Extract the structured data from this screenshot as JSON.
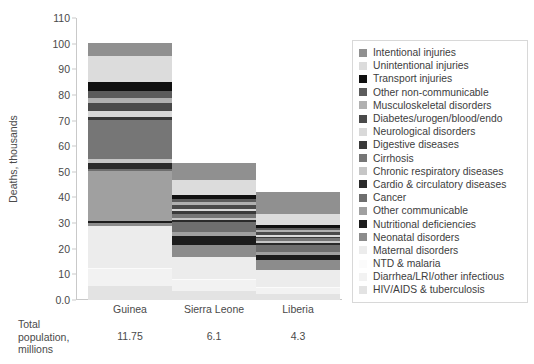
{
  "chart_data": {
    "type": "bar",
    "title": "",
    "subtitle": "",
    "xlabel": "",
    "ylabel": "Deaths, thousands",
    "ylim": [
      0,
      110
    ],
    "yticks": [
      "0.0",
      "10",
      "20",
      "30",
      "40",
      "50",
      "60",
      "70",
      "80",
      "90",
      "100",
      "110"
    ],
    "grid": false,
    "stacked": true,
    "legend_position": "right",
    "categories": [
      "Guinea",
      "Sierra Leone",
      "Liberia"
    ],
    "totals": [
      100.2,
      53.5,
      42.0
    ],
    "series": [
      {
        "name": "HIV/AIDS & tuberculosis",
        "color": "#e3e3e3",
        "values": [
          5.6,
          3.6,
          2.2
        ]
      },
      {
        "name": "Diarrhea/LRI/other infectious",
        "color": "#f2f2f2",
        "values": [
          6.4,
          4.0,
          2.6
        ]
      },
      {
        "name": "NTD & malaria",
        "color": "#fbfbfb",
        "values": [
          0.5,
          0.4,
          0.3
        ]
      },
      {
        "name": "Maternal disorders",
        "color": "#ececec",
        "values": [
          16.5,
          8.6,
          6.7
        ]
      },
      {
        "name": "Neonatal disorders",
        "color": "#8c8c8c",
        "values": [
          0.9,
          5.0,
          3.9
        ]
      },
      {
        "name": "Nutritional deficiencies",
        "color": "#1c1c1c",
        "values": [
          0.7,
          3.2,
          2.0
        ]
      },
      {
        "name": "Other communicable",
        "color": "#a0a0a0",
        "values": [
          19.8,
          1.6,
          1.0
        ]
      },
      {
        "name": "Cancer",
        "color": "#6e6e6e",
        "values": [
          0.8,
          3.8,
          2.9
        ]
      },
      {
        "name": "Cardio & circulatory diseases",
        "color": "#2a2a2a",
        "values": [
          2.4,
          1.0,
          0.7
        ]
      },
      {
        "name": "Chronic respiratory diseases",
        "color": "#c6c6c6",
        "values": [
          1.2,
          0.8,
          0.6
        ]
      },
      {
        "name": "Cirrhosis",
        "color": "#767676",
        "values": [
          15.3,
          1.7,
          1.2
        ]
      },
      {
        "name": "Digestive diseases",
        "color": "#3a3a3a",
        "values": [
          1.1,
          0.9,
          0.6
        ]
      },
      {
        "name": "Neurological disorders",
        "color": "#d9d9d9",
        "values": [
          2.6,
          0.7,
          0.5
        ]
      },
      {
        "name": "Diabetes/urogen/blood/endo",
        "color": "#4a4a4a",
        "values": [
          3.0,
          1.9,
          1.4
        ]
      },
      {
        "name": "Musculoskeletal disorders",
        "color": "#b0b0b0",
        "values": [
          2.1,
          0.9,
          0.6
        ]
      },
      {
        "name": "Other non-communicable",
        "color": "#5c5c5c",
        "values": [
          2.8,
          1.4,
          1.0
        ]
      },
      {
        "name": "Transport injuries",
        "color": "#101010",
        "values": [
          3.3,
          1.6,
          1.2
        ]
      },
      {
        "name": "Unintentional injuries",
        "color": "#dcdcdc",
        "values": [
          10.2,
          5.6,
          4.3
        ]
      },
      {
        "name": "Intentional injuries",
        "color": "#909090",
        "values": [
          5.0,
          6.8,
          8.3
        ]
      }
    ]
  },
  "axis": {
    "y_title": "Deaths, thousands",
    "y_ticks": [
      "110",
      "100",
      "90",
      "80",
      "70",
      "60",
      "50",
      "40",
      "30",
      "20",
      "10",
      "0.0"
    ]
  },
  "x_labels": [
    "Guinea",
    "Sierra Leone",
    "Liberia"
  ],
  "footer": {
    "label": "Total population, millions",
    "label_lines": [
      "Total",
      "population,",
      "millions"
    ],
    "values": [
      "11.75",
      "6.1",
      "4.3"
    ]
  },
  "legend": {
    "items": [
      {
        "label": "Intentional injuries",
        "color": "#909090"
      },
      {
        "label": "Unintentional injuries",
        "color": "#dcdcdc"
      },
      {
        "label": "Transport injuries",
        "color": "#101010"
      },
      {
        "label": "Other non-communicable",
        "color": "#5c5c5c"
      },
      {
        "label": "Musculoskeletal disorders",
        "color": "#b0b0b0"
      },
      {
        "label": "Diabetes/urogen/blood/endo",
        "color": "#4a4a4a"
      },
      {
        "label": "Neurological disorders",
        "color": "#d9d9d9"
      },
      {
        "label": "Digestive diseases",
        "color": "#3a3a3a"
      },
      {
        "label": "Cirrhosis",
        "color": "#767676"
      },
      {
        "label": "Chronic respiratory diseases",
        "color": "#c6c6c6"
      },
      {
        "label": "Cardio & circulatory diseases",
        "color": "#2a2a2a"
      },
      {
        "label": "Cancer",
        "color": "#6e6e6e"
      },
      {
        "label": "Other communicable",
        "color": "#a0a0a0"
      },
      {
        "label": "Nutritional deficiencies",
        "color": "#1c1c1c"
      },
      {
        "label": "Neonatal disorders",
        "color": "#8c8c8c"
      },
      {
        "label": "Maternal disorders",
        "color": "#ececec"
      },
      {
        "label": "NTD & malaria",
        "color": "#fbfbfb"
      },
      {
        "label": "Diarrhea/LRI/other infectious",
        "color": "#f2f2f2"
      },
      {
        "label": "HIV/AIDS & tuberculosis",
        "color": "#e3e3e3"
      }
    ]
  },
  "bar_geometry": {
    "widths_px": [
      84,
      84,
      84
    ],
    "lefts_px": [
      12,
      96,
      180
    ]
  }
}
